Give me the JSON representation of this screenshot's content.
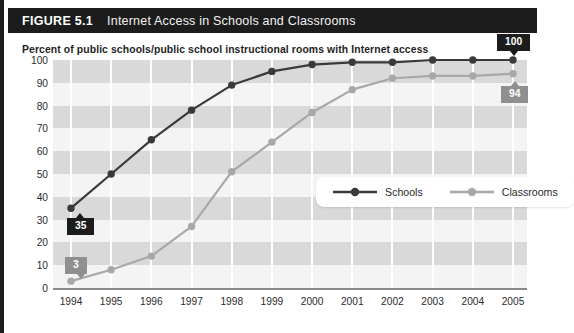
{
  "figure": {
    "number": "FIGURE 5.1",
    "title": "Internet Access in Schools and Classrooms",
    "subtitle": "Percent of public schools/public school instructional rooms with Internet access"
  },
  "colors": {
    "title_bar": "#1c1c1c",
    "schools_line": "#3a3a3a",
    "classrooms_line": "#a8a8a8",
    "band": "#d9d9d9",
    "plot_background": "#f4f4f4",
    "callout_dark": "#1c1c1c",
    "callout_gray": "#8f8f8f"
  },
  "legend": {
    "position": "inside-center-right",
    "entries": [
      {
        "label": "Schools",
        "color": "#3a3a3a"
      },
      {
        "label": "Classrooms",
        "color": "#a8a8a8"
      }
    ]
  },
  "callouts": [
    {
      "id": "schools-start",
      "value": "35",
      "style": "dark",
      "pointer": "up"
    },
    {
      "id": "classrooms-start",
      "value": "3",
      "style": "gray",
      "pointer": "down"
    },
    {
      "id": "schools-end",
      "value": "100",
      "style": "dark",
      "pointer": "down"
    },
    {
      "id": "classrooms-end",
      "value": "94",
      "style": "gray",
      "pointer": "up"
    }
  ],
  "chart_data": {
    "type": "line",
    "title": "Internet Access in Schools and Classrooms",
    "subtitle": "Percent of public schools/public school instructional rooms with Internet access",
    "xlabel": "",
    "ylabel": "Percent",
    "x": [
      1994,
      1995,
      1996,
      1997,
      1998,
      1999,
      2000,
      2001,
      2002,
      2003,
      2004,
      2005
    ],
    "categories": [
      "1994",
      "1995",
      "1996",
      "1997",
      "1998",
      "1999",
      "2000",
      "2001",
      "2002",
      "2003",
      "2004",
      "2005"
    ],
    "yticks": [
      0,
      10,
      20,
      30,
      40,
      50,
      60,
      70,
      80,
      90,
      100
    ],
    "ylim": [
      0,
      100
    ],
    "grid": "horizontal-bands-and-vertical-lines",
    "legend_position": "center-right inside plot",
    "series": [
      {
        "name": "Schools",
        "color": "#3a3a3a",
        "values": [
          35,
          50,
          65,
          78,
          89,
          95,
          98,
          99,
          99,
          100,
          100,
          100
        ]
      },
      {
        "name": "Classrooms",
        "color": "#a8a8a8",
        "values": [
          3,
          8,
          14,
          27,
          51,
          64,
          77,
          87,
          92,
          93,
          93,
          94
        ]
      }
    ],
    "annotations": [
      {
        "series": "Schools",
        "x": 1994,
        "y": 35,
        "text": "35"
      },
      {
        "series": "Classrooms",
        "x": 1994,
        "y": 3,
        "text": "3"
      },
      {
        "series": "Schools",
        "x": 2005,
        "y": 100,
        "text": "100"
      },
      {
        "series": "Classrooms",
        "x": 2005,
        "y": 94,
        "text": "94"
      }
    ]
  }
}
